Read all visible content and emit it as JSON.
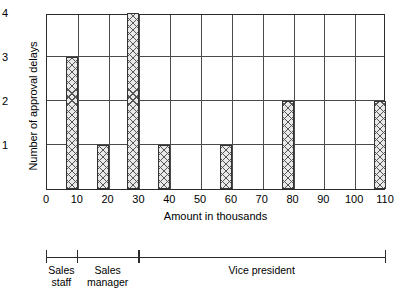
{
  "chart_data": {
    "type": "bar",
    "title": "",
    "xlabel": "Amount in thousands",
    "ylabel": "Number of approval delays",
    "xlim": [
      0,
      110
    ],
    "ylim": [
      0,
      4
    ],
    "grid": true,
    "legend_position": "none",
    "xticks": [
      "0",
      "10",
      "20",
      "30",
      "40",
      "50",
      "60",
      "70",
      "80",
      "90",
      "100",
      "110"
    ],
    "xtick_values": [
      0,
      10,
      20,
      30,
      40,
      50,
      60,
      70,
      80,
      90,
      100,
      110
    ],
    "yticks": [
      "1",
      "2",
      "3",
      "4"
    ],
    "ytick_values": [
      1,
      2,
      3,
      4
    ],
    "categories": [
      10,
      20,
      30,
      40,
      60,
      80,
      110
    ],
    "values": [
      3,
      1,
      4,
      1,
      1,
      2,
      2
    ],
    "bars": [
      {
        "x": 10,
        "value": 3
      },
      {
        "x": 20,
        "value": 1
      },
      {
        "x": 30,
        "value": 4
      },
      {
        "x": 40,
        "value": 1
      },
      {
        "x": 60,
        "value": 1
      },
      {
        "x": 80,
        "value": 2
      },
      {
        "x": 110,
        "value": 2
      }
    ],
    "annotations": [
      {
        "label": "Sales staff",
        "from": 0,
        "to": 10
      },
      {
        "label": "Sales manager",
        "from": 10,
        "to": 30
      },
      {
        "label": "Vice president",
        "from": 30,
        "to": 110
      }
    ]
  },
  "axis": {
    "x_title": "Amount in thousands",
    "y_title": "Number of approval delays"
  },
  "bracket": {
    "groups": [
      {
        "line1": "Sales",
        "line2": "staff"
      },
      {
        "line1": "Sales",
        "line2": "manager"
      },
      {
        "line1": "Vice president",
        "line2": ""
      }
    ]
  },
  "colors": {
    "axis": "#2b2b2b",
    "grid": "#4a4a4a",
    "bar_fill": "#e9e9e9",
    "bar_hatch": "#555555",
    "background": "#ffffff"
  }
}
